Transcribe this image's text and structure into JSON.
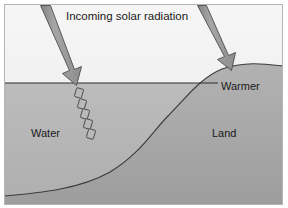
{
  "figure": {
    "name": "differential-heating-land-water-diagram",
    "labels": {
      "title": "Incoming solar radiation",
      "water": "Water",
      "land": "Land",
      "warmer": "Warmer"
    },
    "arrows": [
      {
        "name": "solar-ray-arrow-left",
        "target": "water"
      },
      {
        "name": "solar-ray-arrow-right",
        "target": "land"
      }
    ],
    "penetration_dashes": {
      "name": "water-penetration-dashes",
      "count": 5
    },
    "colors": {
      "sky": "#f1f1f1",
      "water": "#b4b4b4",
      "land": "#a8a8a8",
      "arrow_fill": "#9a9a9a",
      "arrow_stroke": "#4d4d4d",
      "outline": "#3c3c3c",
      "text": "#1a1a1a",
      "frame": "#b0b0b0",
      "page": "#ffffff"
    }
  }
}
